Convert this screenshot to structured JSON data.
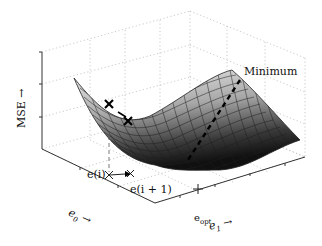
{
  "figure": {
    "type": "3d-surface",
    "axes": {
      "z_label": "MSE →",
      "x_label_base": "e",
      "x_label_sub": "0",
      "x_label_arrow": "→",
      "y_label_base": "e",
      "y_label_sub": "1",
      "y_label_arrow": "→"
    },
    "annotations": {
      "minimum": "Minimum",
      "current_point": "e(i)",
      "next_point": "e(i + 1)",
      "optimum_base": "e",
      "optimum_sub": "opt"
    },
    "colors": {
      "surface_light": "#e8e8e8",
      "surface_dark": "#1a1a1a",
      "mesh": "#222222",
      "grid": "#bbbbbb",
      "axis": "#333333",
      "marker": "#000000"
    },
    "grid": "dotted"
  }
}
